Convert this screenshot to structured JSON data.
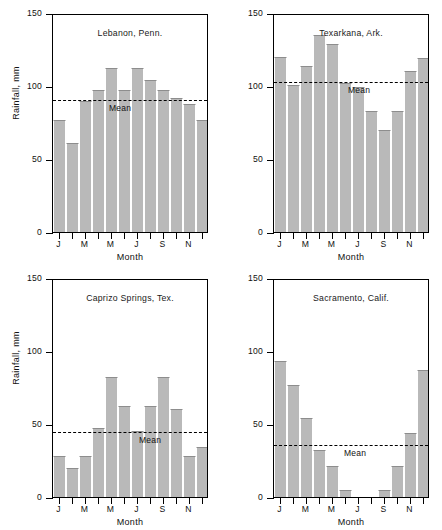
{
  "figure": {
    "panel_count": 4,
    "axis": {
      "y_title": "Rainfall, mm",
      "x_title": "Month",
      "y_ticks": [
        "0",
        "50",
        "100",
        "150"
      ],
      "y_tick_values": [
        0,
        50,
        100,
        150
      ],
      "ylim": [
        0,
        150
      ],
      "x_tick_labels": [
        "J",
        "M",
        "M",
        "J",
        "S",
        "N"
      ],
      "x_tick_label_positions": [
        0,
        2,
        4,
        6,
        8,
        10
      ],
      "mean_label": "Mean"
    }
  },
  "chart_data": [
    {
      "type": "bar",
      "title": "Lebanon, Penn.",
      "xlabel": "Month",
      "ylabel": "Rainfall, mm",
      "ylim": [
        0,
        150
      ],
      "grid": false,
      "legend": "none",
      "categories": [
        "J",
        "F",
        "M",
        "A",
        "M",
        "J",
        "J",
        "A",
        "S",
        "O",
        "N",
        "D"
      ],
      "values": [
        77,
        61,
        90,
        97,
        112,
        97,
        112,
        104,
        97,
        92,
        88,
        77
      ],
      "annotations": [
        {
          "text": "Mean",
          "type": "dashed-hline",
          "value": 92
        }
      ]
    },
    {
      "type": "bar",
      "title": "Texarkana, Ark.",
      "xlabel": "Month",
      "ylabel": "",
      "ylim": [
        0,
        150
      ],
      "grid": false,
      "legend": "none",
      "categories": [
        "J",
        "F",
        "M",
        "A",
        "M",
        "J",
        "J",
        "A",
        "S",
        "O",
        "N",
        "D"
      ],
      "values": [
        120,
        101,
        114,
        135,
        129,
        102,
        99,
        83,
        70,
        83,
        110,
        119
      ],
      "annotations": [
        {
          "text": "Mean",
          "type": "dashed-hline",
          "value": 104
        }
      ]
    },
    {
      "type": "bar",
      "title": "Caprizo Springs, Tex.",
      "xlabel": "Month",
      "ylabel": "Rainfall, mm",
      "ylim": [
        0,
        150
      ],
      "grid": false,
      "legend": "none",
      "categories": [
        "J",
        "F",
        "M",
        "A",
        "M",
        "J",
        "J",
        "A",
        "S",
        "O",
        "N",
        "D"
      ],
      "values": [
        28,
        20,
        28,
        47,
        82,
        62,
        45,
        62,
        82,
        60,
        28,
        34
      ],
      "annotations": [
        {
          "text": "Mean",
          "type": "dashed-hline",
          "value": 46
        }
      ]
    },
    {
      "type": "bar",
      "title": "Sacramento, Calif.",
      "xlabel": "Month",
      "ylabel": "",
      "ylim": [
        0,
        150
      ],
      "grid": false,
      "legend": "none",
      "categories": [
        "J",
        "F",
        "M",
        "A",
        "M",
        "J",
        "J",
        "A",
        "S",
        "O",
        "N",
        "D"
      ],
      "values": [
        93,
        77,
        54,
        32,
        21,
        5,
        0,
        0,
        5,
        21,
        44,
        87
      ],
      "annotations": [
        {
          "text": "Mean",
          "type": "dashed-hline",
          "value": 37
        }
      ]
    }
  ],
  "style": {
    "bar_fill": "#b9b9b9",
    "bar_edge": "#8d8d8d",
    "axis_color": "#000000",
    "text_color": "#111111",
    "background": "#ffffff"
  },
  "panel_meta": [
    {
      "show_y_axis_title": true,
      "mean_label_offset_x": 56
    },
    {
      "show_y_axis_title": false,
      "mean_label_offset_x": 74
    },
    {
      "show_y_axis_title": true,
      "mean_label_offset_x": 86
    },
    {
      "show_y_axis_title": false,
      "mean_label_offset_x": 70
    }
  ]
}
